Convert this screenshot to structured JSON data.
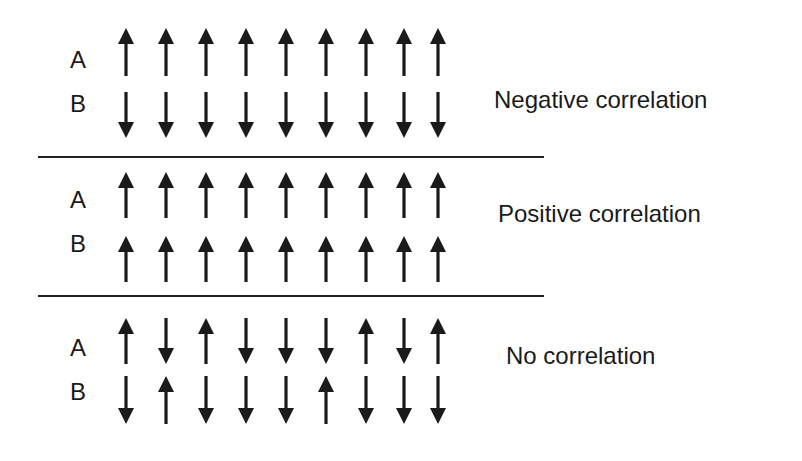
{
  "sections": [
    {
      "caption": "Negative correlation",
      "rows": [
        {
          "label": "A",
          "arrows": [
            "up",
            "up",
            "up",
            "up",
            "up",
            "up",
            "up",
            "up",
            "up"
          ]
        },
        {
          "label": "B",
          "arrows": [
            "down",
            "down",
            "down",
            "down",
            "down",
            "down",
            "down",
            "down",
            "down"
          ]
        }
      ]
    },
    {
      "caption": "Positive correlation",
      "rows": [
        {
          "label": "A",
          "arrows": [
            "up",
            "up",
            "up",
            "up",
            "up",
            "up",
            "up",
            "up",
            "up"
          ]
        },
        {
          "label": "B",
          "arrows": [
            "up",
            "up",
            "up",
            "up",
            "up",
            "up",
            "up",
            "up",
            "up"
          ]
        }
      ]
    },
    {
      "caption": "No correlation",
      "rows": [
        {
          "label": "A",
          "arrows": [
            "up",
            "down",
            "up",
            "down",
            "down",
            "down",
            "up",
            "down",
            "up"
          ]
        },
        {
          "label": "B",
          "arrows": [
            "down",
            "up",
            "down",
            "down",
            "down",
            "up",
            "down",
            "down",
            "down"
          ]
        }
      ]
    }
  ],
  "colors": {
    "ink": "#1a1a1a",
    "background": "#ffffff"
  }
}
